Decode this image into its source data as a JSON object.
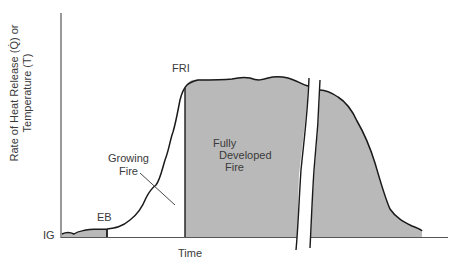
{
  "diagram": {
    "y_axis_label_line1": "Rate of Heat Release (Q̇) or",
    "y_axis_label_line2": "Temperature (T)",
    "x_axis_label": "Time",
    "labels": {
      "ig": "IG",
      "eb": "EB",
      "growing_fire_1": "Growing",
      "growing_fire_2": "Fire",
      "fri": "FRI",
      "fully_developed_1": "Fully",
      "fully_developed_2": "Developed",
      "fully_developed_3": "Fire"
    },
    "colors": {
      "fill": "#b9b9b9",
      "line": "#1a1a1a",
      "axis": "#555555"
    },
    "phases": [
      "Ignition (IG)",
      "Established burning (EB)",
      "Growing Fire",
      "Flashover / Full Room Involvement (FRI)",
      "Fully Developed Fire",
      "Decay"
    ]
  }
}
